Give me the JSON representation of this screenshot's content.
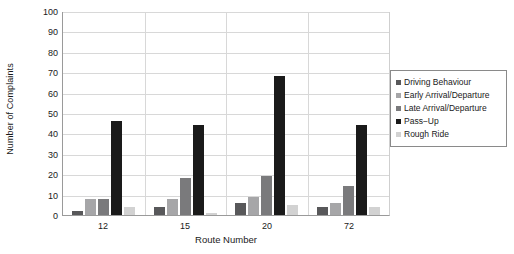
{
  "chart_data": {
    "type": "bar",
    "title": "",
    "xlabel": "Route Number",
    "ylabel": "Number of Complaints",
    "categories": [
      "12",
      "15",
      "20",
      "72"
    ],
    "ylim": [
      0,
      100
    ],
    "yticks": [
      0,
      10,
      20,
      30,
      40,
      50,
      60,
      70,
      80,
      90,
      100
    ],
    "grid": "horizontal",
    "legend_position": "right",
    "series": [
      {
        "name": "Driving Behaviour",
        "color": "#58585a",
        "values": [
          2,
          4,
          6,
          4
        ]
      },
      {
        "name": "Early Arrival/Departure",
        "color": "#a6a6a8",
        "values": [
          8,
          8,
          9,
          6
        ]
      },
      {
        "name": "Late Arrival/Departure",
        "color": "#7a7a7c",
        "values": [
          8,
          18,
          19,
          14
        ]
      },
      {
        "name": "Pass−Up",
        "color": "#1a1a1a",
        "values": [
          46,
          44,
          68,
          44
        ]
      },
      {
        "name": "Rough Ride",
        "color": "#d2d2d2",
        "values": [
          4,
          1,
          5,
          4
        ]
      }
    ]
  }
}
